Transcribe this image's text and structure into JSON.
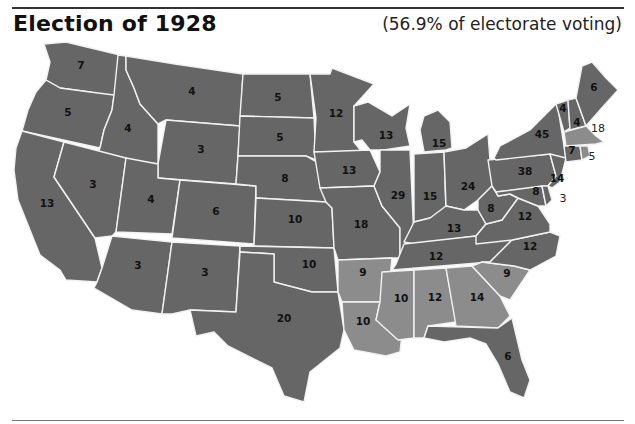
{
  "header": {
    "title": "Election of 1928",
    "subtitle": "(56.9% of electorate voting)"
  },
  "colors": {
    "republican": "#666666",
    "democratic": "#8c8c8c",
    "border": "#f2f2f2",
    "background": "#ffffff"
  },
  "map": {
    "states": [
      {
        "name": "Washington",
        "electoral_votes": "7",
        "party": "republican"
      },
      {
        "name": "Oregon",
        "electoral_votes": "5",
        "party": "republican"
      },
      {
        "name": "California",
        "electoral_votes": "13",
        "party": "republican"
      },
      {
        "name": "Idaho",
        "electoral_votes": "4",
        "party": "republican"
      },
      {
        "name": "Nevada",
        "electoral_votes": "3",
        "party": "republican"
      },
      {
        "name": "Montana",
        "electoral_votes": "4",
        "party": "republican"
      },
      {
        "name": "Wyoming",
        "electoral_votes": "3",
        "party": "republican"
      },
      {
        "name": "Utah",
        "electoral_votes": "4",
        "party": "republican"
      },
      {
        "name": "Arizona",
        "electoral_votes": "3",
        "party": "republican"
      },
      {
        "name": "Colorado",
        "electoral_votes": "6",
        "party": "republican"
      },
      {
        "name": "New Mexico",
        "electoral_votes": "3",
        "party": "republican"
      },
      {
        "name": "North Dakota",
        "electoral_votes": "5",
        "party": "republican"
      },
      {
        "name": "South Dakota",
        "electoral_votes": "5",
        "party": "republican"
      },
      {
        "name": "Nebraska",
        "electoral_votes": "8",
        "party": "republican"
      },
      {
        "name": "Kansas",
        "electoral_votes": "10",
        "party": "republican"
      },
      {
        "name": "Oklahoma",
        "electoral_votes": "10",
        "party": "republican"
      },
      {
        "name": "Texas",
        "electoral_votes": "20",
        "party": "republican"
      },
      {
        "name": "Minnesota",
        "electoral_votes": "12",
        "party": "republican"
      },
      {
        "name": "Iowa",
        "electoral_votes": "13",
        "party": "republican"
      },
      {
        "name": "Missouri",
        "electoral_votes": "18",
        "party": "republican"
      },
      {
        "name": "Arkansas",
        "electoral_votes": "9",
        "party": "democratic"
      },
      {
        "name": "Louisiana",
        "electoral_votes": "10",
        "party": "democratic"
      },
      {
        "name": "Wisconsin",
        "electoral_votes": "13",
        "party": "republican"
      },
      {
        "name": "Illinois",
        "electoral_votes": "29",
        "party": "republican"
      },
      {
        "name": "Michigan",
        "electoral_votes": "15",
        "party": "republican"
      },
      {
        "name": "Indiana",
        "electoral_votes": "15",
        "party": "republican"
      },
      {
        "name": "Ohio",
        "electoral_votes": "24",
        "party": "republican"
      },
      {
        "name": "Kentucky",
        "electoral_votes": "13",
        "party": "republican"
      },
      {
        "name": "Tennessee",
        "electoral_votes": "12",
        "party": "republican"
      },
      {
        "name": "Mississippi",
        "electoral_votes": "10",
        "party": "democratic"
      },
      {
        "name": "Alabama",
        "electoral_votes": "12",
        "party": "democratic"
      },
      {
        "name": "Georgia",
        "electoral_votes": "14",
        "party": "democratic"
      },
      {
        "name": "Florida",
        "electoral_votes": "6",
        "party": "republican"
      },
      {
        "name": "South Carolina",
        "electoral_votes": "9",
        "party": "democratic"
      },
      {
        "name": "North Carolina",
        "electoral_votes": "12",
        "party": "republican"
      },
      {
        "name": "Virginia",
        "electoral_votes": "12",
        "party": "republican"
      },
      {
        "name": "West Virginia",
        "electoral_votes": "8",
        "party": "republican"
      },
      {
        "name": "Pennsylvania",
        "electoral_votes": "38",
        "party": "republican"
      },
      {
        "name": "New York",
        "electoral_votes": "45",
        "party": "republican"
      },
      {
        "name": "New Jersey",
        "electoral_votes": "14",
        "party": "republican"
      },
      {
        "name": "Maryland",
        "electoral_votes": "8",
        "party": "republican"
      },
      {
        "name": "Delaware",
        "electoral_votes": "3",
        "party": "republican"
      },
      {
        "name": "Vermont",
        "electoral_votes": "4",
        "party": "republican"
      },
      {
        "name": "New Hampshire",
        "electoral_votes": "4",
        "party": "republican"
      },
      {
        "name": "Maine",
        "electoral_votes": "6",
        "party": "republican"
      },
      {
        "name": "Massachusetts",
        "electoral_votes": "18",
        "party": "democratic"
      },
      {
        "name": "Connecticut",
        "electoral_votes": "7",
        "party": "republican"
      },
      {
        "name": "Rhode Island",
        "electoral_votes": "5",
        "party": "democratic"
      }
    ]
  }
}
